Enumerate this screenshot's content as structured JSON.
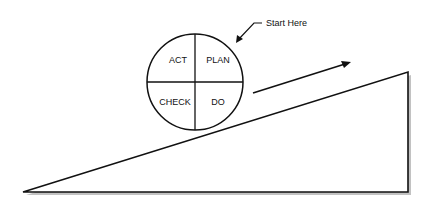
{
  "diagram": {
    "quadrants": {
      "top_left": "ACT",
      "top_right": "PLAN",
      "bottom_left": "CHECK",
      "bottom_right": "DO"
    },
    "callout": "Start Here",
    "colors": {
      "stroke": "#111111",
      "shadow": "#9a9a9a",
      "background": "#ffffff"
    }
  }
}
